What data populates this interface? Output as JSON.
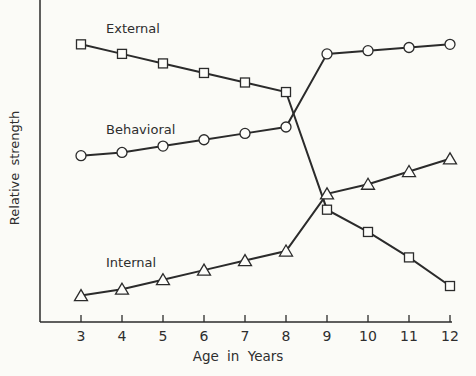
{
  "chart_data": {
    "type": "line",
    "title": "",
    "xlabel": "Age in Years",
    "ylabel": "Relative strength",
    "x": [
      3,
      4,
      5,
      6,
      7,
      8,
      9,
      10,
      11,
      12
    ],
    "x_tick_labels": [
      "3",
      "4",
      "5",
      "6",
      "7",
      "8",
      "9",
      "10",
      "11",
      "12"
    ],
    "y_ticks": [],
    "ylim": [
      0,
      100
    ],
    "grid": false,
    "legend": "inline labels on lines",
    "series": [
      {
        "name": "External",
        "marker": "square",
        "values": [
          87,
          84,
          81,
          78,
          75,
          72,
          35,
          28,
          20,
          11
        ]
      },
      {
        "name": "Behavioral",
        "marker": "circle",
        "values": [
          52,
          53,
          55,
          57,
          59,
          61,
          84,
          85,
          86,
          87
        ]
      },
      {
        "name": "Internal",
        "marker": "triangle",
        "values": [
          8,
          10,
          13,
          16,
          19,
          22,
          40,
          43,
          47,
          51
        ]
      }
    ]
  },
  "labels": {
    "external": "External",
    "behavioral": "Behavioral",
    "internal": "Internal",
    "xlabel": "Age in Years",
    "ylabel": "Relative strength"
  }
}
